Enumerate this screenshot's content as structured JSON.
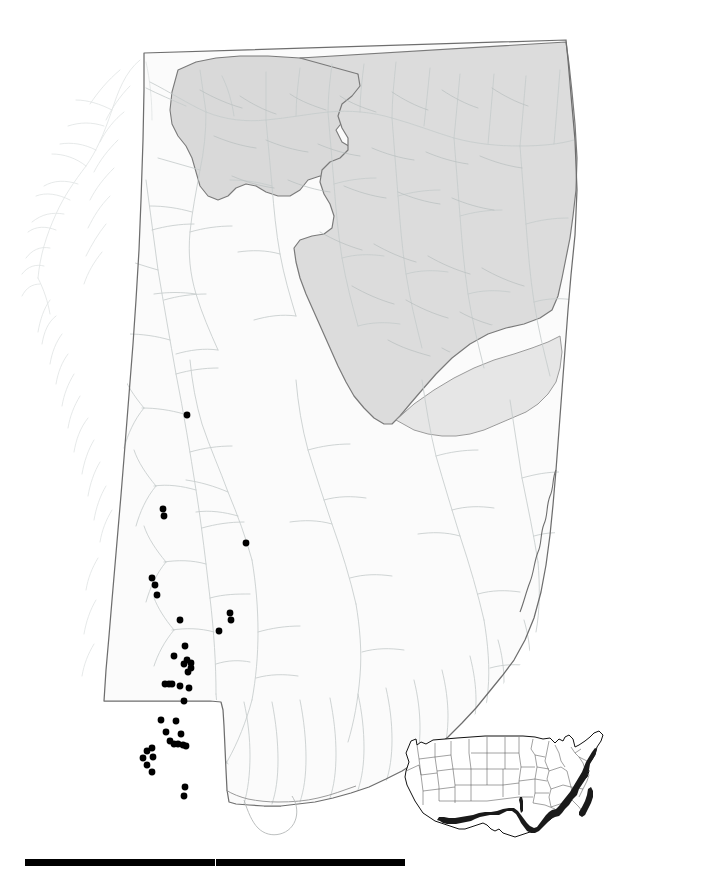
{
  "figure": {
    "description": "Outline map of the State of Alabama with hydrography (stream network), two shaded physiographic provinces in the northern half of the state, and filled black circular symbols marking occurrence records concentrated along a north-south band in southwestern Alabama.",
    "background_color": "#ffffff"
  },
  "main_map": {
    "name": "alabama-state-map",
    "state_outline_color": "#6e6e6e",
    "state_fill_color": "#fbfbfb",
    "river_color": "#c3c9c9",
    "river_color_faint": "#dfe3e3",
    "shaded_province_fill": "#dedede",
    "shaded_province_fill_2": "#d5d5d5",
    "shaded_province_outline": "#7a7a7a",
    "point_color": "#000000",
    "point_radius_px": 3.4,
    "point_count": 41
  },
  "occurrence_points": [
    {
      "x": 187,
      "y": 415
    },
    {
      "x": 163,
      "y": 509
    },
    {
      "x": 164,
      "y": 516
    },
    {
      "x": 246,
      "y": 543
    },
    {
      "x": 152,
      "y": 578
    },
    {
      "x": 155,
      "y": 585
    },
    {
      "x": 157,
      "y": 595
    },
    {
      "x": 230,
      "y": 613
    },
    {
      "x": 231,
      "y": 620
    },
    {
      "x": 180,
      "y": 620
    },
    {
      "x": 219,
      "y": 631
    },
    {
      "x": 185,
      "y": 646
    },
    {
      "x": 174,
      "y": 656
    },
    {
      "x": 187,
      "y": 660
    },
    {
      "x": 184,
      "y": 664
    },
    {
      "x": 191,
      "y": 663
    },
    {
      "x": 191,
      "y": 668
    },
    {
      "x": 188,
      "y": 672
    },
    {
      "x": 165,
      "y": 684
    },
    {
      "x": 169,
      "y": 684
    },
    {
      "x": 172,
      "y": 684
    },
    {
      "x": 180,
      "y": 686
    },
    {
      "x": 189,
      "y": 688
    },
    {
      "x": 184,
      "y": 701
    },
    {
      "x": 161,
      "y": 720
    },
    {
      "x": 176,
      "y": 721
    },
    {
      "x": 166,
      "y": 732
    },
    {
      "x": 181,
      "y": 734
    },
    {
      "x": 170,
      "y": 741
    },
    {
      "x": 174,
      "y": 744
    },
    {
      "x": 178,
      "y": 744
    },
    {
      "x": 183,
      "y": 745
    },
    {
      "x": 186,
      "y": 746
    },
    {
      "x": 147,
      "y": 751
    },
    {
      "x": 152,
      "y": 748
    },
    {
      "x": 143,
      "y": 758
    },
    {
      "x": 153,
      "y": 757
    },
    {
      "x": 147,
      "y": 765
    },
    {
      "x": 152,
      "y": 772
    },
    {
      "x": 185,
      "y": 787
    },
    {
      "x": 184,
      "y": 796
    }
  ],
  "inset_map": {
    "name": "united-states-inset",
    "description": "Small outline map of the conterminous United States with state boundaries; the Atlantic and Gulf Coastal Plain is shaded dark along the eastern seaboard, Florida, and the Gulf coast.",
    "outline_color": "#111111",
    "state_line_color": "#4d4d4d",
    "highlight_color": "#1a1a1a",
    "highlight_region": "Atlantic and Gulf Coastal Plain"
  },
  "scale_bar": {
    "name": "scale-bar",
    "color": "#000000",
    "segments": 2,
    "label": ""
  }
}
